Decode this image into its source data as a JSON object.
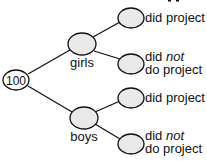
{
  "diagram": {
    "type": "tree",
    "root": {
      "label": "100"
    },
    "branches": [
      {
        "label": "girls",
        "leaves": [
          {
            "line1": "did project",
            "line2": ""
          },
          {
            "line1_prefix": "did ",
            "line1_emph": "not",
            "line2": "do project"
          }
        ]
      },
      {
        "label": "boys",
        "leaves": [
          {
            "line1": "did project",
            "line2": ""
          },
          {
            "line1_prefix": "did ",
            "line1_emph": "not",
            "line2": "do project"
          }
        ]
      }
    ],
    "colors": {
      "node_fill": "#e9e9e9",
      "stroke": "#111111",
      "text": "#111111"
    }
  }
}
